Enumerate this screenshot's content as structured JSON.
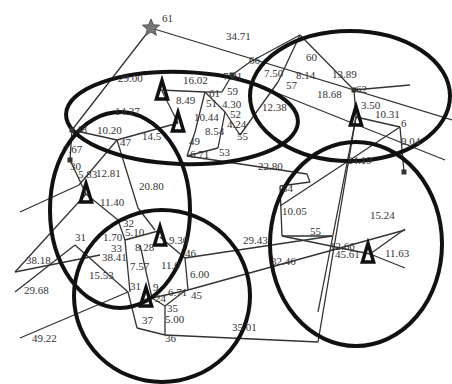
{
  "diagram": {
    "type": "network-partition",
    "width": 452,
    "height": 384,
    "colors": {
      "edge": "#333333",
      "ellipse": "#111111",
      "star": "#777777",
      "label": "#333333"
    },
    "ellipses": [
      {
        "id": "top-left",
        "cx": 182,
        "cy": 118,
        "rx": 116,
        "ry": 46,
        "rot": 2
      },
      {
        "id": "top-right",
        "cx": 350,
        "cy": 96,
        "rx": 100,
        "ry": 65,
        "rot": 0
      },
      {
        "id": "left",
        "cx": 120,
        "cy": 210,
        "rx": 70,
        "ry": 98,
        "rot": 0
      },
      {
        "id": "bottom-center",
        "cx": 162,
        "cy": 296,
        "rx": 88,
        "ry": 86,
        "rot": 0
      },
      {
        "id": "right",
        "cx": 356,
        "cy": 244,
        "rx": 86,
        "ry": 102,
        "rot": 0
      }
    ],
    "source": {
      "x": 151,
      "y": 28,
      "label": "61"
    },
    "substations": [
      {
        "id": "t1",
        "x": 162,
        "y": 91
      },
      {
        "id": "t2",
        "x": 178,
        "y": 123
      },
      {
        "id": "t3",
        "x": 356,
        "y": 117
      },
      {
        "id": "t4",
        "x": 86,
        "y": 194
      },
      {
        "id": "t5",
        "x": 160,
        "y": 237
      },
      {
        "id": "t6",
        "x": 146,
        "y": 298
      },
      {
        "id": "t7",
        "x": 368,
        "y": 254
      }
    ],
    "edges": [
      [
        151,
        28,
        452,
        120
      ],
      [
        151,
        28,
        72,
        130
      ],
      [
        160,
        90,
        205,
        92
      ],
      [
        205,
        92,
        222,
        92
      ],
      [
        222,
        92,
        232,
        75
      ],
      [
        232,
        75,
        250,
        62
      ],
      [
        232,
        75,
        445,
        160
      ],
      [
        250,
        62,
        300,
        35
      ],
      [
        300,
        35,
        278,
        82
      ],
      [
        278,
        82,
        240,
        135
      ],
      [
        300,
        35,
        354,
        90
      ],
      [
        354,
        90,
        410,
        85
      ],
      [
        354,
        90,
        356,
        117
      ],
      [
        356,
        117,
        400,
        127
      ],
      [
        400,
        127,
        280,
        206
      ],
      [
        400,
        127,
        404,
        172
      ],
      [
        356,
        117,
        318,
        312
      ],
      [
        205,
        92,
        195,
        132
      ],
      [
        195,
        132,
        187,
        156
      ],
      [
        205,
        92,
        225,
        112
      ],
      [
        225,
        112,
        240,
        135
      ],
      [
        225,
        112,
        218,
        148
      ],
      [
        187,
        156,
        218,
        148
      ],
      [
        187,
        156,
        307,
        174
      ],
      [
        307,
        174,
        310,
        182
      ],
      [
        280,
        186,
        310,
        182
      ],
      [
        280,
        186,
        282,
        236
      ],
      [
        282,
        236,
        370,
        254
      ],
      [
        370,
        254,
        405,
        229
      ],
      [
        370,
        254,
        405,
        268
      ],
      [
        72,
        130,
        117,
        140
      ],
      [
        117,
        140,
        178,
        123
      ],
      [
        178,
        123,
        162,
        91
      ],
      [
        117,
        140,
        79,
        185
      ],
      [
        79,
        185,
        20,
        212
      ],
      [
        72,
        130,
        70,
        160
      ],
      [
        70,
        160,
        86,
        194
      ],
      [
        117,
        140,
        138,
        208
      ],
      [
        138,
        208,
        155,
        230
      ],
      [
        86,
        194,
        118,
        220
      ],
      [
        118,
        220,
        125,
        240
      ],
      [
        125,
        240,
        162,
        230
      ],
      [
        125,
        240,
        130,
        292
      ],
      [
        86,
        194,
        15,
        272
      ],
      [
        75,
        245,
        15,
        292
      ],
      [
        75,
        245,
        128,
        292
      ],
      [
        160,
        237,
        185,
        258
      ],
      [
        185,
        258,
        188,
        290
      ],
      [
        188,
        290,
        152,
        298
      ],
      [
        152,
        298,
        165,
        306
      ],
      [
        165,
        306,
        186,
        290
      ],
      [
        165,
        306,
        165,
        335
      ],
      [
        165,
        335,
        137,
        328
      ],
      [
        137,
        328,
        128,
        292
      ],
      [
        128,
        292,
        20,
        338
      ],
      [
        165,
        335,
        318,
        342
      ],
      [
        318,
        342,
        356,
        117
      ],
      [
        185,
        258,
        332,
        236
      ],
      [
        332,
        236,
        282,
        236
      ],
      [
        188,
        290,
        405,
        230
      ],
      [
        152,
        298,
        140,
        245
      ],
      [
        100,
        255,
        15,
        272
      ]
    ],
    "nodes": [
      {
        "x": 72,
        "y": 130
      },
      {
        "x": 70,
        "y": 160
      },
      {
        "x": 232,
        "y": 75
      },
      {
        "x": 354,
        "y": 90
      },
      {
        "x": 404,
        "y": 172
      }
    ],
    "labels": [
      {
        "x": 162,
        "y": 22,
        "text": "61"
      },
      {
        "x": 226,
        "y": 40,
        "text": "34.71"
      },
      {
        "x": 118,
        "y": 82,
        "text": "29.00"
      },
      {
        "x": 183,
        "y": 84,
        "text": "16.02"
      },
      {
        "x": 223,
        "y": 80,
        "text": "7.81"
      },
      {
        "x": 249,
        "y": 64,
        "text": "66"
      },
      {
        "x": 264,
        "y": 77,
        "text": "7.50"
      },
      {
        "x": 306,
        "y": 61,
        "text": "60"
      },
      {
        "x": 296,
        "y": 79,
        "text": "8.14"
      },
      {
        "x": 332,
        "y": 78,
        "text": "13.89"
      },
      {
        "x": 286,
        "y": 89,
        "text": "57"
      },
      {
        "x": 317,
        "y": 98,
        "text": "18.68"
      },
      {
        "x": 356,
        "y": 93,
        "text": "62"
      },
      {
        "x": 361,
        "y": 109,
        "text": "3.50"
      },
      {
        "x": 375,
        "y": 118,
        "text": "10.31"
      },
      {
        "x": 401,
        "y": 127,
        "text": "6"
      },
      {
        "x": 401,
        "y": 145,
        "text": "9.04"
      },
      {
        "x": 209,
        "y": 97,
        "text": "61"
      },
      {
        "x": 227,
        "y": 95,
        "text": "59"
      },
      {
        "x": 176,
        "y": 104,
        "text": "8.49"
      },
      {
        "x": 206,
        "y": 107,
        "text": "51"
      },
      {
        "x": 222,
        "y": 108,
        "text": "4.30"
      },
      {
        "x": 194,
        "y": 121,
        "text": "10.44"
      },
      {
        "x": 230,
        "y": 118,
        "text": "52"
      },
      {
        "x": 227,
        "y": 128,
        "text": "4.24"
      },
      {
        "x": 262,
        "y": 111,
        "text": "12.38"
      },
      {
        "x": 115,
        "y": 115,
        "text": "14.27"
      },
      {
        "x": 76,
        "y": 133,
        "text": "48"
      },
      {
        "x": 97,
        "y": 134,
        "text": "10.20"
      },
      {
        "x": 142,
        "y": 140,
        "text": "14.5"
      },
      {
        "x": 120,
        "y": 146,
        "text": "47"
      },
      {
        "x": 205,
        "y": 135,
        "text": "8.54"
      },
      {
        "x": 237,
        "y": 140,
        "text": "55"
      },
      {
        "x": 189,
        "y": 145,
        "text": "49"
      },
      {
        "x": 190,
        "y": 158,
        "text": "6.71"
      },
      {
        "x": 219,
        "y": 156,
        "text": "53"
      },
      {
        "x": 258,
        "y": 170,
        "text": "22.80"
      },
      {
        "x": 63,
        "y": 153,
        "text": "7.67"
      },
      {
        "x": 70,
        "y": 170,
        "text": "30"
      },
      {
        "x": 78,
        "y": 178,
        "text": "5.83"
      },
      {
        "x": 96,
        "y": 177,
        "text": "12.81"
      },
      {
        "x": 347,
        "y": 164,
        "text": "24.19"
      },
      {
        "x": 139,
        "y": 190,
        "text": "20.80"
      },
      {
        "x": 282,
        "y": 192,
        "text": "54"
      },
      {
        "x": 100,
        "y": 206,
        "text": "11.40"
      },
      {
        "x": 123,
        "y": 227,
        "text": "32"
      },
      {
        "x": 125,
        "y": 236,
        "text": "5.10"
      },
      {
        "x": 103,
        "y": 241,
        "text": "1.70"
      },
      {
        "x": 169,
        "y": 244,
        "text": "9.30"
      },
      {
        "x": 282,
        "y": 215,
        "text": "10.05"
      },
      {
        "x": 370,
        "y": 219,
        "text": "15.24"
      },
      {
        "x": 75,
        "y": 241,
        "text": "31"
      },
      {
        "x": 111,
        "y": 252,
        "text": "33"
      },
      {
        "x": 135,
        "y": 251,
        "text": "8.28"
      },
      {
        "x": 102,
        "y": 261,
        "text": "38.41"
      },
      {
        "x": 185,
        "y": 257,
        "text": "46"
      },
      {
        "x": 243,
        "y": 244,
        "text": "29.43"
      },
      {
        "x": 310,
        "y": 235,
        "text": "55"
      },
      {
        "x": 335,
        "y": 258,
        "text": "45.61"
      },
      {
        "x": 330,
        "y": 250,
        "text": "12.66"
      },
      {
        "x": 385,
        "y": 257,
        "text": "11.63"
      },
      {
        "x": 26,
        "y": 264,
        "text": "38.18"
      },
      {
        "x": 130,
        "y": 270,
        "text": "7.57"
      },
      {
        "x": 161,
        "y": 269,
        "text": "11.0"
      },
      {
        "x": 271,
        "y": 265,
        "text": "32.46"
      },
      {
        "x": 89,
        "y": 279,
        "text": "15.53"
      },
      {
        "x": 190,
        "y": 278,
        "text": "6.00"
      },
      {
        "x": 130,
        "y": 290,
        "text": "31"
      },
      {
        "x": 153,
        "y": 291,
        "text": "9"
      },
      {
        "x": 168,
        "y": 296,
        "text": "6.71"
      },
      {
        "x": 24,
        "y": 294,
        "text": "29.68"
      },
      {
        "x": 155,
        "y": 302,
        "text": "24"
      },
      {
        "x": 191,
        "y": 299,
        "text": "45"
      },
      {
        "x": 167,
        "y": 312,
        "text": "35"
      },
      {
        "x": 165,
        "y": 323,
        "text": "5.00"
      },
      {
        "x": 142,
        "y": 324,
        "text": "37"
      },
      {
        "x": 232,
        "y": 331,
        "text": "35.01"
      },
      {
        "x": 165,
        "y": 342,
        "text": "36"
      },
      {
        "x": 32,
        "y": 342,
        "text": "49.22"
      }
    ]
  }
}
